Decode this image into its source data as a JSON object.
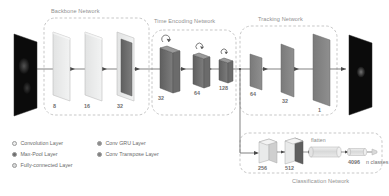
{
  "figure": {
    "groups": [
      {
        "id": "backbone",
        "label": "Backbone Network"
      },
      {
        "id": "time_encoding",
        "label": "Time Encoding Network"
      },
      {
        "id": "tracking",
        "label": "Tracking Network"
      },
      {
        "id": "classification",
        "label": "Classification Network"
      }
    ],
    "backbone": {
      "label": "Backbone Network",
      "layers": [
        {
          "channels": "8",
          "type": "convolution"
        },
        {
          "channels": "16",
          "type": "convolution"
        },
        {
          "channels": "32",
          "type": "convolution-maxpool"
        }
      ]
    },
    "time_encoding": {
      "label": "Time Encoding Network",
      "layers": [
        {
          "channels": "32",
          "type": "conv-gru"
        },
        {
          "channels": "64",
          "type": "conv-gru"
        },
        {
          "channels": "128",
          "type": "conv-gru"
        }
      ]
    },
    "tracking": {
      "label": "Tracking Network",
      "layers": [
        {
          "channels": "64",
          "type": "conv-transpose"
        },
        {
          "channels": "32",
          "type": "conv-transpose"
        },
        {
          "channels": "1",
          "type": "conv-transpose"
        }
      ]
    },
    "classification": {
      "label": "Classification Network",
      "flatten_label": "flatten",
      "layers": [
        {
          "units": "256",
          "type": "convolution"
        },
        {
          "units": "512",
          "type": "convolution-maxpool"
        },
        {
          "units": "4096",
          "type": "fully-connected"
        },
        {
          "units": "n classes",
          "type": "fully-connected"
        }
      ]
    },
    "input_image": {
      "name": "input-frame"
    },
    "output_image": {
      "name": "output-heatmap"
    },
    "legend": {
      "items": [
        {
          "label": "Convolution Layer",
          "color": "#eceded",
          "swatch": "c-conv"
        },
        {
          "label": "Max-Pool Layer",
          "color": "#6e6e6e",
          "swatch": "c-pool"
        },
        {
          "label": "Fully-connected Layer",
          "color": "#d7d8d8",
          "swatch": "c-fc"
        },
        {
          "label": "Conv GRU Layer",
          "color": "#8d8d8d",
          "swatch": "c-gru"
        },
        {
          "label": "Conv Transpose Layer",
          "color": "#818181",
          "swatch": "c-tr"
        }
      ]
    }
  }
}
